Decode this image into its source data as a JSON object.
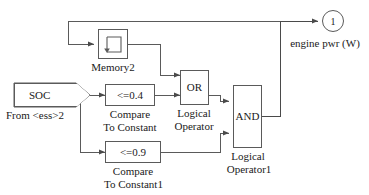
{
  "diagram": {
    "line_color": "#5a5a5a",
    "background": "#ffffff"
  },
  "blocks": {
    "soc": {
      "label": "SOC",
      "caption": "From <ess>2",
      "type": "from-block"
    },
    "memory": {
      "icon": "memory-unit-delay-icon",
      "caption": "Memory2",
      "type": "memory-block"
    },
    "compare_1": {
      "label": "<=0.4",
      "caption_line1": "Compare",
      "caption_line2": "To Constant",
      "type": "compare-to-constant"
    },
    "compare_2": {
      "label": "<=0.9",
      "caption_line1": "Compare",
      "caption_line2": "To Constant1",
      "type": "compare-to-constant"
    },
    "logic_or": {
      "label": "OR",
      "caption_line1": "Logical",
      "caption_line2": "Operator",
      "type": "logical-operator"
    },
    "logic_and": {
      "label": "AND",
      "caption_line1": "Logical",
      "caption_line2": "Operator1",
      "type": "logical-operator"
    },
    "output_port": {
      "label": "1",
      "caption": "engine pwr (W)",
      "type": "outport"
    }
  }
}
